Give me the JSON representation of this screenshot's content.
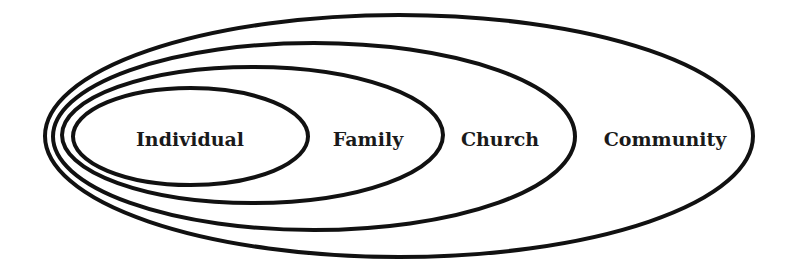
{
  "diagram": {
    "type": "nested-ellipses",
    "stroke_color": "#111111",
    "background": "#ffffff",
    "rings": [
      {
        "label": "Community",
        "cx": 399,
        "cy": 136,
        "rx": 354,
        "ry": 121,
        "label_x": 665
      },
      {
        "label": "Church",
        "cx": 314,
        "cy": 136.5,
        "rx": 261,
        "ry": 93.5,
        "label_x": 500
      },
      {
        "label": "Family",
        "cx": 252.5,
        "cy": 135,
        "rx": 190.5,
        "ry": 68,
        "label_x": 368
      },
      {
        "label": "Individual",
        "cx": 190.5,
        "cy": 136.5,
        "rx": 117.5,
        "ry": 48.5,
        "label_x": 190
      }
    ],
    "label_y": 146
  }
}
